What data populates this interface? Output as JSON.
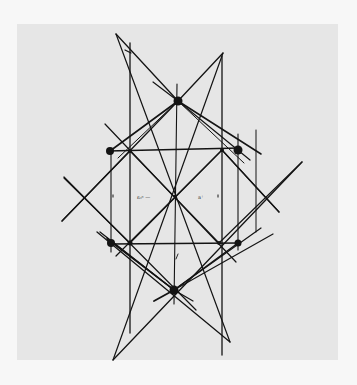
{
  "diagram": {
    "canvas": {
      "width": 357,
      "height": 385,
      "background": "#f7f7f7"
    },
    "panel": {
      "x": 17,
      "y": 24,
      "width": 321,
      "height": 336,
      "fill": "#e6e6e6"
    },
    "stroke_color": "#141414",
    "nodes": [
      {
        "id": "top",
        "x": 178,
        "y": 101,
        "r": 4.5
      },
      {
        "id": "bottom",
        "x": 174,
        "y": 290,
        "r": 4.5
      },
      {
        "id": "outer-top-left",
        "x": 110,
        "y": 151,
        "r": 4
      },
      {
        "id": "outer-top-right",
        "x": 238,
        "y": 150,
        "r": 4.5
      },
      {
        "id": "outer-bottom-left",
        "x": 111,
        "y": 243,
        "r": 4
      },
      {
        "id": "outer-bottom-right",
        "x": 238,
        "y": 243,
        "r": 3.5
      },
      {
        "id": "inner-top-left",
        "x": 130,
        "y": 151,
        "r": 2
      },
      {
        "id": "inner-top-right",
        "x": 222,
        "y": 150,
        "r": 2
      },
      {
        "id": "inner-bottom-left",
        "x": 130,
        "y": 243,
        "r": 2.5
      },
      {
        "id": "inner-bottom-right",
        "x": 219,
        "y": 243,
        "r": 2
      },
      {
        "id": "center",
        "x": 175,
        "y": 196,
        "r": 1.2
      }
    ],
    "lines": [
      {
        "id": "vert-left",
        "x1": 130,
        "y1": 43,
        "x2": 130,
        "y2": 333,
        "w": 1.3
      },
      {
        "id": "vert-right",
        "x1": 222,
        "y1": 56,
        "x2": 222,
        "y2": 355,
        "w": 1.3
      },
      {
        "id": "vert-center",
        "x1": 177,
        "y1": 84,
        "x2": 174,
        "y2": 304,
        "w": 1.1
      },
      {
        "id": "vert-outer-left",
        "x1": 111,
        "y1": 150,
        "x2": 111,
        "y2": 252,
        "w": 1.1
      },
      {
        "id": "vert-outer-right",
        "x1": 238,
        "y1": 134,
        "x2": 238,
        "y2": 250,
        "w": 1.1
      },
      {
        "id": "vert-far-right",
        "x1": 256,
        "y1": 130,
        "x2": 256,
        "y2": 232,
        "w": 1.0
      },
      {
        "id": "top-tick",
        "x1": 125,
        "y1": 50,
        "x2": 131,
        "y2": 53,
        "w": 1.2
      },
      {
        "id": "horiz-top",
        "x1": 108,
        "y1": 151,
        "x2": 240,
        "y2": 148,
        "w": 1.5
      },
      {
        "id": "horiz-bottom",
        "x1": 110,
        "y1": 244,
        "x2": 240,
        "y2": 243,
        "w": 1.5
      },
      {
        "id": "diag-long-nw-se",
        "x1": 116,
        "y1": 34,
        "x2": 230,
        "y2": 342,
        "w": 0
      },
      {
        "id": "diag-top-to-upper-left",
        "x1": 116,
        "y1": 34,
        "x2": 178,
        "y2": 101,
        "w": 1.3
      },
      {
        "id": "diag-top-to-upper-right",
        "x1": 178,
        "y1": 101,
        "x2": 223,
        "y2": 53,
        "w": 1.3
      },
      {
        "id": "diag-short-top-left",
        "x1": 153,
        "y1": 82,
        "x2": 178,
        "y2": 101,
        "w": 1.2
      },
      {
        "id": "x-main-a",
        "x1": 104,
        "y1": 124,
        "x2": 279,
        "y2": 212,
        "w": 0
      },
      {
        "id": "x-left-down",
        "x1": 105,
        "y1": 125,
        "x2": 278,
        "y2": 213,
        "w": 0
      },
      {
        "id": "big-diag-left-upper",
        "x1": 62,
        "y1": 221,
        "x2": 178,
        "y2": 101,
        "w": 1.3
      },
      {
        "id": "big-diag-right-upper",
        "x1": 178,
        "y1": 101,
        "x2": 261,
        "y2": 154,
        "w": 1.5
      },
      {
        "id": "fan-top-right-1",
        "x1": 178,
        "y1": 101,
        "x2": 250,
        "y2": 160,
        "w": 1.2
      },
      {
        "id": "fan-top-right-2",
        "x1": 178,
        "y1": 101,
        "x2": 244,
        "y2": 163,
        "w": 1.0
      },
      {
        "id": "fan-top-left-1",
        "x1": 178,
        "y1": 101,
        "x2": 110,
        "y2": 151,
        "w": 1.6
      },
      {
        "id": "fan-top-left-2",
        "x1": 178,
        "y1": 101,
        "x2": 118,
        "y2": 158,
        "w": 1.0
      },
      {
        "id": "x-diag-nw-se-inner",
        "x1": 105,
        "y1": 124,
        "x2": 280,
        "y2": 212,
        "w": 0
      },
      {
        "id": "diag-nw-se-full",
        "x1": 104,
        "y1": 124,
        "x2": 279,
        "y2": 213,
        "w": 0
      },
      {
        "id": "diag-upper-left-to-lower-right",
        "x1": 105,
        "y1": 124,
        "x2": 236,
        "y2": 262,
        "w": 1.2
      },
      {
        "id": "diag-upper-right-to-lower-left",
        "x1": 222,
        "y1": 150,
        "x2": 116,
        "y2": 256,
        "w": 1.2
      },
      {
        "id": "diag-inner-tl-br",
        "x1": 130,
        "y1": 151,
        "x2": 219,
        "y2": 243,
        "w": 0
      },
      {
        "id": "left-x-a",
        "x1": 64,
        "y1": 178,
        "x2": 178,
        "y2": 296,
        "w": 0
      },
      {
        "id": "left-big-x-down",
        "x1": 64,
        "y1": 177,
        "x2": 196,
        "y2": 310,
        "w": 1.2
      },
      {
        "id": "left-big-x-up",
        "x1": 62,
        "y1": 221,
        "x2": 130,
        "y2": 151,
        "w": 0
      },
      {
        "id": "right-big-x-down",
        "x1": 130,
        "y1": 151,
        "x2": 279,
        "y2": 213,
        "w": 0
      },
      {
        "id": "right-diag-down",
        "x1": 222,
        "y1": 150,
        "x2": 279,
        "y2": 212,
        "w": 1.2
      },
      {
        "id": "right-big-x-up",
        "x1": 302,
        "y1": 162,
        "x2": 113,
        "y2": 360,
        "w": 1.3
      },
      {
        "id": "lower-left-cross",
        "x1": 97,
        "y1": 232,
        "x2": 230,
        "y2": 342,
        "w": 1.3
      },
      {
        "id": "lower-left-cross-2",
        "x1": 107,
        "y1": 238,
        "x2": 174,
        "y2": 290,
        "w": 1.5
      },
      {
        "id": "fan-bottom-right-1",
        "x1": 174,
        "y1": 290,
        "x2": 273,
        "y2": 234,
        "w": 1.2
      },
      {
        "id": "fan-bottom-right-2",
        "x1": 174,
        "y1": 290,
        "x2": 261,
        "y2": 228,
        "w": 1.2
      },
      {
        "id": "fan-bottom-right-3",
        "x1": 174,
        "y1": 290,
        "x2": 238,
        "y2": 243,
        "w": 1.4
      },
      {
        "id": "fan-bottom-left-tail",
        "x1": 174,
        "y1": 290,
        "x2": 154,
        "y2": 301,
        "w": 1.8
      },
      {
        "id": "bottom-right-tail",
        "x1": 174,
        "y1": 290,
        "x2": 193,
        "y2": 301,
        "w": 1.2
      },
      {
        "id": "slash-tick",
        "x1": 178,
        "y1": 254,
        "x2": 176,
        "y2": 259,
        "w": 0.9
      }
    ],
    "labels": [
      {
        "id": "label-left",
        "text": "ε₀ⁿ —",
        "x": 137,
        "y": 199
      },
      {
        "id": "label-right",
        "text": "a⁺",
        "x": 198,
        "y": 199
      }
    ],
    "small_ticks": [
      {
        "x": 113,
        "y": 196
      },
      {
        "x": 218,
        "y": 196
      }
    ]
  }
}
